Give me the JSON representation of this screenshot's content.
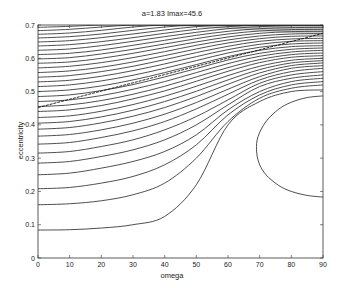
{
  "chart_data": {
    "type": "line",
    "title": "a=1.83 Imax=45.6",
    "xlabel": "omega",
    "ylabel": "eccentricity",
    "xlim": [
      0,
      90
    ],
    "ylim": [
      0,
      0.7
    ],
    "xticks": [
      0,
      10,
      20,
      30,
      40,
      50,
      60,
      70,
      80,
      90
    ],
    "yticks": [
      0,
      0.1,
      0.2,
      0.3,
      0.4,
      0.5,
      0.6,
      0.7
    ],
    "grid": false,
    "legend": null,
    "line_color": "#222222",
    "x": [
      0,
      10,
      20,
      30,
      40,
      50,
      60,
      70,
      80,
      90
    ],
    "series": [
      {
        "name": "contour-1",
        "values": [
          0.084,
          0.085,
          0.09,
          0.1,
          0.125,
          0.22,
          0.4,
          0.47,
          0.5,
          0.505
        ]
      },
      {
        "name": "contour-2",
        "values": [
          0.16,
          0.163,
          0.172,
          0.19,
          0.225,
          0.3,
          0.41,
          0.48,
          0.51,
          0.52
        ]
      },
      {
        "name": "contour-3",
        "values": [
          0.208,
          0.212,
          0.225,
          0.245,
          0.28,
          0.34,
          0.43,
          0.49,
          0.52,
          0.53
        ]
      },
      {
        "name": "contour-4",
        "values": [
          0.25,
          0.255,
          0.27,
          0.29,
          0.32,
          0.37,
          0.445,
          0.5,
          0.53,
          0.54
        ]
      },
      {
        "name": "contour-5",
        "values": [
          0.285,
          0.29,
          0.305,
          0.325,
          0.355,
          0.4,
          0.46,
          0.515,
          0.54,
          0.55
        ]
      },
      {
        "name": "contour-6",
        "values": [
          0.315,
          0.32,
          0.335,
          0.355,
          0.385,
          0.425,
          0.475,
          0.525,
          0.55,
          0.56
        ]
      },
      {
        "name": "contour-7",
        "values": [
          0.342,
          0.347,
          0.362,
          0.382,
          0.41,
          0.448,
          0.492,
          0.535,
          0.56,
          0.57
        ]
      },
      {
        "name": "contour-8",
        "values": [
          0.366,
          0.371,
          0.385,
          0.405,
          0.432,
          0.467,
          0.507,
          0.545,
          0.57,
          0.578
        ]
      },
      {
        "name": "contour-9",
        "values": [
          0.387,
          0.392,
          0.406,
          0.426,
          0.452,
          0.485,
          0.522,
          0.556,
          0.578,
          0.586
        ]
      },
      {
        "name": "contour-10",
        "values": [
          0.405,
          0.41,
          0.424,
          0.444,
          0.47,
          0.501,
          0.535,
          0.566,
          0.586,
          0.593
        ]
      },
      {
        "name": "contour-11",
        "values": [
          0.422,
          0.427,
          0.441,
          0.461,
          0.486,
          0.516,
          0.548,
          0.576,
          0.594,
          0.6
        ]
      },
      {
        "name": "contour-12",
        "values": [
          0.44,
          0.445,
          0.458,
          0.478,
          0.502,
          0.531,
          0.561,
          0.587,
          0.603,
          0.608
        ]
      },
      {
        "name": "contour-13",
        "values": [
          0.455,
          0.46,
          0.473,
          0.492,
          0.516,
          0.544,
          0.572,
          0.596,
          0.611,
          0.616
        ]
      },
      {
        "name": "contour-14",
        "values": [
          0.47,
          0.475,
          0.488,
          0.507,
          0.53,
          0.557,
          0.584,
          0.606,
          0.619,
          0.624
        ]
      },
      {
        "name": "contour-15",
        "values": [
          0.485,
          0.49,
          0.503,
          0.521,
          0.544,
          0.569,
          0.595,
          0.615,
          0.627,
          0.631
        ]
      },
      {
        "name": "contour-16",
        "values": [
          0.5,
          0.505,
          0.517,
          0.535,
          0.557,
          0.581,
          0.605,
          0.624,
          0.635,
          0.638
        ]
      },
      {
        "name": "contour-17",
        "values": [
          0.515,
          0.52,
          0.532,
          0.549,
          0.57,
          0.593,
          0.616,
          0.633,
          0.643,
          0.646
        ]
      },
      {
        "name": "contour-18",
        "values": [
          0.529,
          0.534,
          0.546,
          0.563,
          0.583,
          0.605,
          0.626,
          0.642,
          0.651,
          0.653
        ]
      },
      {
        "name": "contour-19",
        "values": [
          0.543,
          0.548,
          0.56,
          0.576,
          0.596,
          0.617,
          0.636,
          0.651,
          0.658,
          0.66
        ]
      },
      {
        "name": "contour-20",
        "values": [
          0.557,
          0.562,
          0.573,
          0.589,
          0.608,
          0.628,
          0.646,
          0.659,
          0.666,
          0.667
        ]
      },
      {
        "name": "contour-21",
        "values": [
          0.571,
          0.576,
          0.587,
          0.602,
          0.62,
          0.639,
          0.655,
          0.667,
          0.673,
          0.674
        ]
      },
      {
        "name": "contour-22",
        "values": [
          0.585,
          0.589,
          0.6,
          0.615,
          0.632,
          0.649,
          0.664,
          0.675,
          0.68,
          0.681
        ]
      },
      {
        "name": "contour-23",
        "values": [
          0.598,
          0.602,
          0.613,
          0.627,
          0.643,
          0.659,
          0.673,
          0.682,
          0.686,
          0.687
        ]
      },
      {
        "name": "contour-24",
        "values": [
          0.611,
          0.615,
          0.625,
          0.639,
          0.654,
          0.669,
          0.681,
          0.689,
          0.692,
          0.693
        ]
      },
      {
        "name": "contour-25",
        "values": [
          0.624,
          0.628,
          0.638,
          0.651,
          0.665,
          0.678,
          0.689,
          0.695,
          0.698,
          0.698
        ]
      },
      {
        "name": "contour-26",
        "values": [
          0.637,
          0.641,
          0.65,
          0.662,
          0.675,
          0.687,
          0.695,
          0.7,
          0.7,
          0.7
        ]
      },
      {
        "name": "contour-27",
        "values": [
          0.649,
          0.653,
          0.662,
          0.673,
          0.685,
          0.695,
          0.7,
          0.7,
          0.7,
          0.7
        ]
      },
      {
        "name": "contour-28",
        "values": [
          0.661,
          0.665,
          0.673,
          0.684,
          0.694,
          0.7,
          0.7,
          0.7,
          0.7,
          0.7
        ]
      },
      {
        "name": "contour-29",
        "values": [
          0.672,
          0.676,
          0.684,
          0.694,
          0.7,
          0.7,
          0.7,
          0.7,
          0.7,
          0.7
        ]
      },
      {
        "name": "contour-30",
        "values": [
          0.683,
          0.687,
          0.694,
          0.7,
          0.7,
          0.7,
          0.7,
          0.7,
          0.7,
          0.7
        ]
      },
      {
        "name": "contour-31",
        "values": [
          0.693,
          0.696,
          0.7,
          0.7,
          0.7,
          0.7,
          0.7,
          0.7,
          0.7,
          0.7
        ]
      }
    ],
    "closed_contours": [
      {
        "name": "island",
        "points": [
          [
            90,
            0.487
          ],
          [
            85,
            0.482
          ],
          [
            80,
            0.468
          ],
          [
            76,
            0.447
          ],
          [
            72,
            0.41
          ],
          [
            69.5,
            0.365
          ],
          [
            69,
            0.325
          ],
          [
            69.8,
            0.285
          ],
          [
            72,
            0.25
          ],
          [
            76,
            0.218
          ],
          [
            80,
            0.2
          ],
          [
            85,
            0.188
          ],
          [
            90,
            0.183
          ]
        ]
      }
    ],
    "separatrix": {
      "name": "diagonal-line",
      "points": [
        [
          0,
          0.452
        ],
        [
          90,
          0.675
        ]
      ]
    }
  }
}
